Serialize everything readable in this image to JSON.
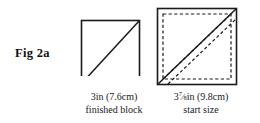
{
  "figure": {
    "label": "Fig 2a",
    "background_color": "#ffffff",
    "line_color": "#1a1a1a"
  },
  "panels": [
    {
      "name": "finished-block",
      "shape": "square",
      "diagonal": "bottom-left-to-top-right",
      "has_seam_allowance": false,
      "has_stitch_lines": false,
      "caption_lines": [
        "3in (7.6cm)",
        "finished block"
      ],
      "size_inches": "3",
      "size_cm": "7.6"
    },
    {
      "name": "start-size",
      "shape": "square",
      "diagonal": "bottom-left-to-top-right",
      "has_seam_allowance": true,
      "has_stitch_lines": true,
      "caption_lines": [
        "3 7/8in (9.8cm)",
        "start size"
      ],
      "size_inches_whole": "3",
      "size_inches_numerator": "7",
      "size_inches_denominator": "8",
      "size_unit": "in (9.8cm)",
      "size_cm": "9.8"
    }
  ],
  "captions": {
    "finished": {
      "line1": "3in (7.6cm)",
      "line2": "finished block"
    },
    "start": {
      "whole": "3",
      "numerator": "7",
      "denominator": "8",
      "unit_and_metric": "in (9.8cm)",
      "line2": "start size"
    }
  }
}
